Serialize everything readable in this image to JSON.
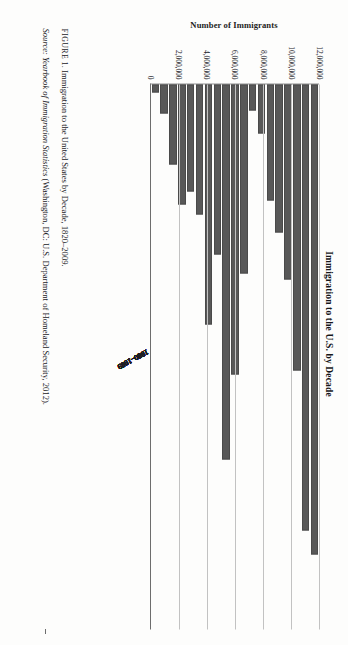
{
  "figure": {
    "label": "FIGURE 1.",
    "caption": "Immigration to the United States by Decade, 1820–2009.",
    "source_word": "Source:",
    "source_title": "Yearbook of Immigration Statistics",
    "source_rest": "(Washington, DC: U.S. Department of Homeland Security, 2012)."
  },
  "chart_data": {
    "type": "bar",
    "orientation": "horizontal",
    "title": "Immigration to the U.S. by Decade",
    "xlabel": "",
    "ylabel": "Number of Immigrants",
    "ylim": [
      0,
      12000000
    ],
    "grid": true,
    "legend": "none",
    "bar_color": "#585858",
    "tick_labels": [
      "12,000,000",
      "10,000,000",
      "8,000,000",
      "6,000,000",
      "4,000,000",
      "2,000,000",
      "0"
    ],
    "tick_values": [
      12000000,
      10000000,
      8000000,
      6000000,
      4000000,
      2000000,
      0
    ],
    "categories": [
      "2000–2009",
      "1990–1999",
      "1980–1989",
      "1970–1979",
      "1960–1969",
      "1950–1959",
      "1940–1949",
      "1930–1939",
      "1920–1929",
      "1910–1919",
      "1900–1909",
      "1890–1899",
      "1880–1889",
      "1870–1879",
      "1860–1869",
      "1850–1859",
      "1840–1849",
      "1830–1839",
      "1820–1829"
    ],
    "values": [
      10299430,
      9775398,
      6244379,
      4248203,
      3213749,
      2515479,
      1035039,
      528431,
      4107209,
      6347380,
      8202388,
      3694294,
      5248568,
      2812191,
      2314824,
      2598214,
      1713251,
      599125,
      128502
    ]
  }
}
